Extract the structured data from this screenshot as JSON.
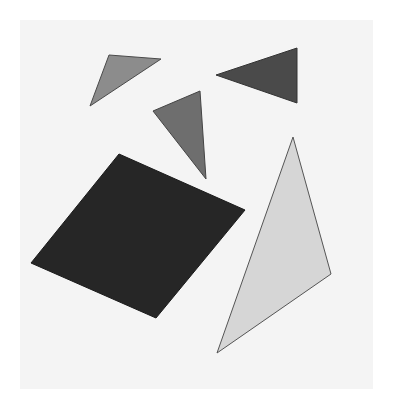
{
  "canvas": {
    "width": 393,
    "height": 407,
    "background": "#ffffff",
    "panel": {
      "x": 20,
      "y": 20,
      "width": 353,
      "height": 369,
      "fill": "#f4f4f4"
    }
  },
  "shapes": [
    {
      "id": "small-gray-triangle",
      "type": "triangle",
      "points": "109,55 161,59 90,106",
      "fill": "#8c8c8c",
      "stroke": "#4a4a4a"
    },
    {
      "id": "dark-right-triangle",
      "type": "triangle",
      "points": "216,75 297,48 297,103",
      "fill": "#4a4a4a",
      "stroke": "#333333"
    },
    {
      "id": "medium-gray-triangle",
      "type": "triangle",
      "points": "153,111 200,91 206,179",
      "fill": "#6e6e6e",
      "stroke": "#444444"
    },
    {
      "id": "black-parallelogram",
      "type": "quadrilateral",
      "points": "119,154 245,210 156,318 31,263",
      "fill": "#262626",
      "stroke": "#1a1a1a"
    },
    {
      "id": "light-large-triangle",
      "type": "triangle",
      "points": "293,137 331,274 217,353",
      "fill": "#d6d6d6",
      "stroke": "#555555"
    }
  ]
}
